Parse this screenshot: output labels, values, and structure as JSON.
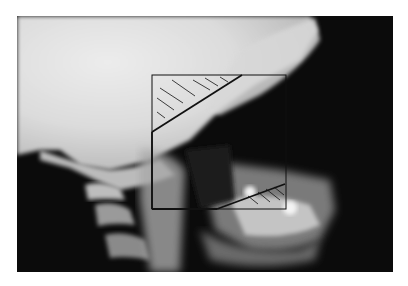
{
  "figure": {
    "type": "lateral cephalometric radiograph",
    "background": "#ffffff",
    "colors": {
      "skull_bright": "#e8e8e8",
      "soft_dark": "#0a0a0a",
      "overlay_line": "#111111"
    },
    "overlay": {
      "shape": "rectangle-with-diagonal-cutoffs",
      "rect": {
        "x": 152,
        "y": 75,
        "width": 134,
        "height": 134
      },
      "upper_diagonal": {
        "x1": 152,
        "y1": 132,
        "x2": 242,
        "y2": 75
      },
      "lower_diagonal": {
        "x1": 217,
        "y1": 209,
        "x2": 285,
        "y2": 184
      },
      "hatched_regions": [
        "upper-left-triangle",
        "lower-right-triangle"
      ]
    }
  }
}
